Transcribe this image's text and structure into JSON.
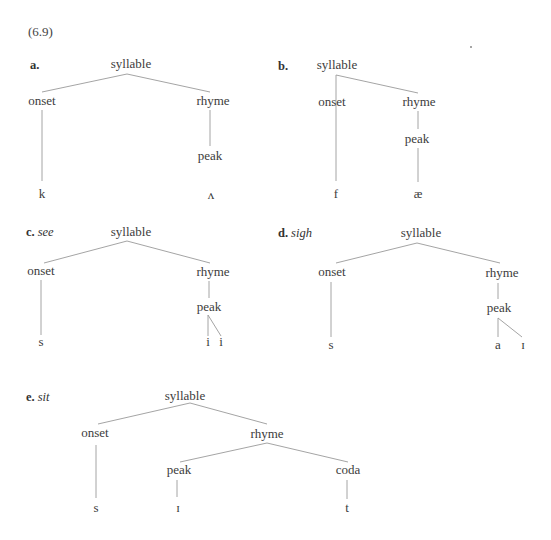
{
  "figure": {
    "equation_number": "(6.9)",
    "examples": [
      {
        "id": "a",
        "letter": "a.",
        "word": "",
        "label_pos": [
          30,
          58
        ],
        "nodes": [
          {
            "id": "syllable",
            "text": "syllable",
            "x": 131,
            "y": 64
          },
          {
            "id": "onset",
            "text": "onset",
            "x": 42,
            "y": 101
          },
          {
            "id": "rhyme",
            "text": "rhyme",
            "x": 213,
            "y": 101
          },
          {
            "id": "peak",
            "text": "peak",
            "x": 210,
            "y": 156
          },
          {
            "id": "seg1",
            "text": "k",
            "x": 42,
            "y": 194
          },
          {
            "id": "seg2",
            "text": "ʌ",
            "x": 211,
            "y": 195
          }
        ],
        "edges": [
          [
            127,
            74,
            42,
            92
          ],
          [
            127,
            74,
            210,
            92
          ],
          [
            42,
            110,
            42,
            181
          ],
          [
            210,
            110,
            210,
            146
          ]
        ]
      },
      {
        "id": "b",
        "letter": "b.",
        "word": "",
        "label_pos": [
          278,
          59
        ],
        "nodes": [
          {
            "id": "syllable",
            "text": "syllable",
            "x": 337,
            "y": 65
          },
          {
            "id": "onset",
            "text": "onset",
            "x": 332,
            "y": 102
          },
          {
            "id": "rhyme",
            "text": "rhyme",
            "x": 419,
            "y": 102
          },
          {
            "id": "peak",
            "text": "peak",
            "x": 417,
            "y": 139
          },
          {
            "id": "seg1",
            "text": "f",
            "x": 336,
            "y": 194
          },
          {
            "id": "seg2",
            "text": "æ",
            "x": 418,
            "y": 194
          }
        ],
        "edges": [
          [
            336,
            75,
            336,
            181
          ],
          [
            336,
            75,
            418,
            93
          ],
          [
            418,
            111,
            418,
            129
          ],
          [
            418,
            148,
            418,
            182
          ]
        ]
      },
      {
        "id": "c",
        "letter": "c.",
        "word": "see",
        "label_pos": [
          26,
          225
        ],
        "nodes": [
          {
            "id": "syllable",
            "text": "syllable",
            "x": 131,
            "y": 232
          },
          {
            "id": "onset",
            "text": "onset",
            "x": 41,
            "y": 271
          },
          {
            "id": "rhyme",
            "text": "rhyme",
            "x": 213,
            "y": 272
          },
          {
            "id": "peak",
            "text": "peak",
            "x": 209,
            "y": 307
          },
          {
            "id": "seg1",
            "text": "s",
            "x": 41,
            "y": 342
          },
          {
            "id": "seg2",
            "text": "i",
            "x": 208,
            "y": 342
          },
          {
            "id": "seg3",
            "text": "i",
            "x": 221,
            "y": 342
          }
        ],
        "edges": [
          [
            127,
            241,
            44,
            263
          ],
          [
            127,
            241,
            210,
            263
          ],
          [
            41,
            280,
            41,
            335
          ],
          [
            209,
            281,
            209,
            298
          ],
          [
            208,
            315,
            208,
            336
          ],
          [
            208,
            315,
            221,
            336
          ]
        ]
      },
      {
        "id": "d",
        "letter": "d.",
        "word": "sigh",
        "label_pos": [
          278,
          226
        ],
        "nodes": [
          {
            "id": "syllable",
            "text": "syllable",
            "x": 421,
            "y": 233
          },
          {
            "id": "onset",
            "text": "onset",
            "x": 332,
            "y": 272
          },
          {
            "id": "rhyme",
            "text": "rhyme",
            "x": 502,
            "y": 273
          },
          {
            "id": "peak",
            "text": "peak",
            "x": 499,
            "y": 308
          },
          {
            "id": "seg1",
            "text": "s",
            "x": 331,
            "y": 345
          },
          {
            "id": "seg2",
            "text": "a",
            "x": 498,
            "y": 345
          },
          {
            "id": "seg3",
            "text": "ɪ",
            "x": 523,
            "y": 345
          }
        ],
        "edges": [
          [
            417,
            243,
            336,
            263
          ],
          [
            417,
            243,
            500,
            263
          ],
          [
            331,
            282,
            331,
            337
          ],
          [
            498,
            283,
            498,
            299
          ],
          [
            498,
            318,
            498,
            337
          ],
          [
            498,
            318,
            522,
            337
          ]
        ]
      },
      {
        "id": "e",
        "letter": "e.",
        "word": "sit",
        "label_pos": [
          26,
          390
        ],
        "nodes": [
          {
            "id": "syllable",
            "text": "syllable",
            "x": 185,
            "y": 396
          },
          {
            "id": "onset",
            "text": "onset",
            "x": 95,
            "y": 433
          },
          {
            "id": "rhyme",
            "text": "rhyme",
            "x": 267,
            "y": 434
          },
          {
            "id": "peak",
            "text": "peak",
            "x": 179,
            "y": 470
          },
          {
            "id": "coda",
            "text": "coda",
            "x": 348,
            "y": 470
          },
          {
            "id": "seg1",
            "text": "s",
            "x": 96,
            "y": 508
          },
          {
            "id": "seg2",
            "text": "ɪ",
            "x": 178,
            "y": 508
          },
          {
            "id": "seg3",
            "text": "t",
            "x": 347,
            "y": 508
          }
        ],
        "edges": [
          [
            190,
            403,
            98,
            424
          ],
          [
            190,
            403,
            267,
            424
          ],
          [
            96,
            445,
            96,
            498
          ],
          [
            267,
            443,
            180,
            462
          ],
          [
            267,
            443,
            348,
            462
          ],
          [
            177,
            480,
            177,
            497
          ],
          [
            347,
            480,
            347,
            499
          ]
        ]
      }
    ]
  }
}
